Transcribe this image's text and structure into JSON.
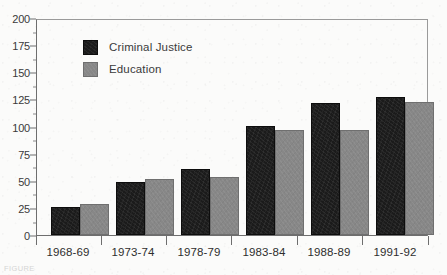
{
  "chart_data": {
    "type": "bar",
    "title": "",
    "xlabel": "",
    "ylabel": "",
    "ylim": [
      0,
      200
    ],
    "ytick_step": 25,
    "yticks": [
      0,
      25,
      50,
      75,
      100,
      125,
      150,
      175,
      200
    ],
    "ytick_labels": [
      "0",
      "25",
      "50",
      "75",
      "100",
      "125",
      "150",
      "175",
      "200"
    ],
    "grid": false,
    "legend_position": "upper-left-inside",
    "categories": [
      "1968-69",
      "1973-74",
      "1978-79",
      "1983-84",
      "1988-89",
      "1991-92"
    ],
    "series": [
      {
        "name": "Criminal Justice",
        "color": "#1b1b1b",
        "values": [
          26,
          49,
          61,
          101,
          123,
          128
        ]
      },
      {
        "name": "Education",
        "color": "#878787",
        "values": [
          29,
          52,
          54,
          98,
          98,
          124
        ]
      }
    ]
  },
  "legend": {
    "items": [
      {
        "label": "Criminal Justice",
        "swatch": "cj"
      },
      {
        "label": "Education",
        "swatch": "ed"
      }
    ]
  },
  "caption": {
    "remnant": "FIGURE"
  }
}
